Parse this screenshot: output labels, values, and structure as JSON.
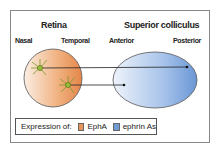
{
  "retina": {
    "title": "Retina",
    "left_label": "Nasal",
    "right_label": "Temporal"
  },
  "colliculus": {
    "title": "Superior colliculus",
    "left_label": "Anterior",
    "right_label": "Posterior"
  },
  "legend": {
    "prefix": "Expression of:",
    "items": [
      {
        "label": "EphA",
        "color": "#e8955a"
      },
      {
        "label": "ephrin As",
        "color": "#6f9bd6"
      }
    ]
  }
}
